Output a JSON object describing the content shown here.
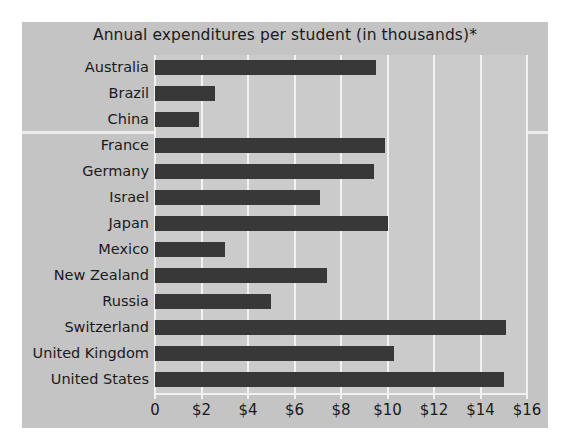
{
  "chart_data": {
    "type": "bar",
    "orientation": "horizontal",
    "title": "Annual expenditures per student (in thousands)*",
    "xlabel": "",
    "ylabel": "",
    "xlim": [
      0,
      16
    ],
    "grid": true,
    "legend": "none",
    "categories": [
      "Australia",
      "Brazil",
      "China",
      "France",
      "Germany",
      "Israel",
      "Japan",
      "Mexico",
      "New Zealand",
      "Russia",
      "Switzerland",
      "United Kingdom",
      "United States"
    ],
    "values": [
      9.5,
      2.6,
      1.9,
      9.9,
      9.4,
      7.1,
      10.0,
      3.0,
      7.4,
      5.0,
      15.1,
      10.3,
      15.0
    ],
    "xticks": [
      0,
      2,
      4,
      6,
      8,
      10,
      12,
      14,
      16
    ],
    "xticklabels": [
      "0",
      "$2",
      "$4",
      "$6",
      "$8",
      "$10",
      "$12",
      "$14",
      "$16"
    ],
    "colors": {
      "bar": "#383838",
      "figure_background": "#c4c4c4",
      "plot_background": "#cbcbcb",
      "gridline": "#f2f2f2",
      "text": "#1a1a1a"
    }
  }
}
